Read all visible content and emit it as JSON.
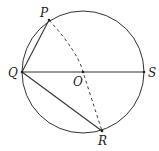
{
  "diagram": {
    "labels": {
      "P": "P",
      "Q": "Q",
      "O": "O",
      "S": "S",
      "R": "R"
    },
    "circle": {
      "cx": 83,
      "cy": 72,
      "r": 61
    },
    "points": {
      "P": [
        49,
        20
      ],
      "Q": [
        22,
        72
      ],
      "O": [
        83,
        72
      ],
      "S": [
        144,
        72
      ],
      "R": [
        102,
        131
      ]
    },
    "segments": [
      {
        "from": "Q",
        "to": "P",
        "style": "solid"
      },
      {
        "from": "Q",
        "to": "S",
        "style": "solid"
      },
      {
        "from": "Q",
        "to": "R",
        "style": "solid"
      },
      {
        "from": "P",
        "to": "R",
        "style": "dashed",
        "via": "O"
      }
    ],
    "stroke_color": "#333333"
  }
}
